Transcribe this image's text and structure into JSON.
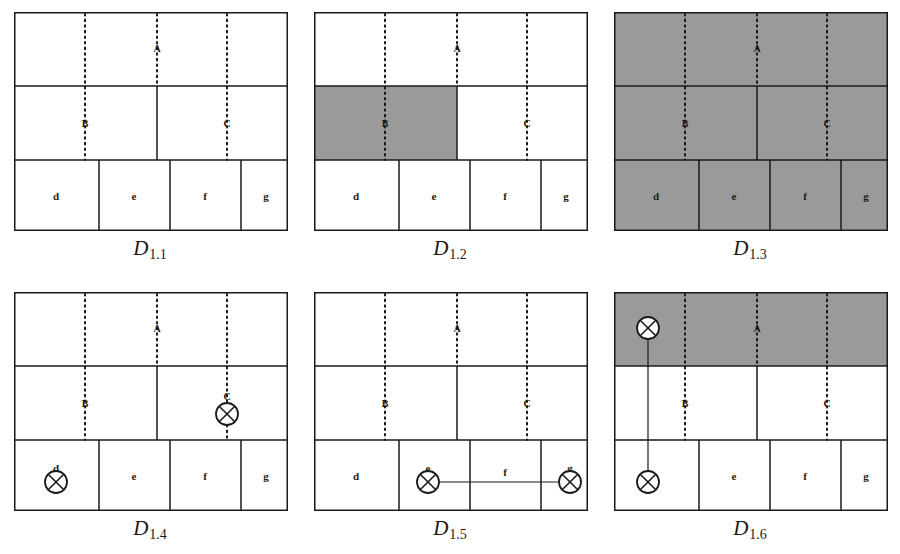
{
  "figure": {
    "kind": "grid-diagram-series",
    "background_color": "#ffffff",
    "line_color": "#1a1a1a",
    "shade_color": "#9a9a9a",
    "panel_count": 6,
    "columns": 3,
    "rows": 2
  },
  "geometry": {
    "box_width": 274,
    "box_height": 219,
    "row_dividers_y": [
      74,
      148
    ],
    "top_row_divider_x": [],
    "middle_row_divider_x": [
      143
    ],
    "bottom_row_divider_x": [
      85,
      156,
      227
    ],
    "dotted_x": [
      71,
      143,
      213
    ],
    "dotted_labels": [
      "B",
      "A",
      "C"
    ]
  },
  "node_labels": {
    "a": "A",
    "b": "B",
    "c": "C",
    "d": "d",
    "e": "e",
    "f": "f",
    "g": "g"
  },
  "panels": [
    {
      "id": "D1.1",
      "caption_main": "D",
      "caption_sub": "1.1",
      "shaded_regions": [],
      "markers": [],
      "links": []
    },
    {
      "id": "D1.2",
      "caption_main": "D",
      "caption_sub": "1.2",
      "shaded_regions": [
        {
          "name": "middle-row-left",
          "x": 0,
          "y": 74,
          "w": 143,
          "h": 74
        }
      ],
      "markers": [],
      "links": []
    },
    {
      "id": "D1.3",
      "caption_main": "D",
      "caption_sub": "1.3",
      "shaded_regions": [
        {
          "name": "whole-box",
          "x": 0,
          "y": 0,
          "w": 274,
          "h": 219
        }
      ],
      "markers": [],
      "links": []
    },
    {
      "id": "D1.4",
      "caption_main": "D",
      "caption_sub": "1.4",
      "shaded_regions": [],
      "markers": [
        {
          "name": "marker-c",
          "cx": 213,
          "cy": 122,
          "r": 11
        },
        {
          "name": "marker-d",
          "cx": 42,
          "cy": 190,
          "r": 11
        }
      ],
      "links": []
    },
    {
      "id": "D1.5",
      "caption_main": "D",
      "caption_sub": "1.5",
      "shaded_regions": [],
      "markers": [
        {
          "name": "marker-e",
          "cx": 114,
          "cy": 190,
          "r": 11
        },
        {
          "name": "marker-g",
          "cx": 256,
          "cy": 190,
          "r": 11
        }
      ],
      "links": [
        {
          "name": "link-e-g",
          "x1": 125,
          "y1": 190,
          "x2": 245,
          "y2": 190
        }
      ]
    },
    {
      "id": "D1.6",
      "caption_main": "D",
      "caption_sub": "1.6",
      "shaded_regions": [
        {
          "name": "top-row",
          "x": 0,
          "y": 0,
          "w": 274,
          "h": 74
        }
      ],
      "markers": [
        {
          "name": "marker-top",
          "cx": 34,
          "cy": 36,
          "r": 11
        },
        {
          "name": "marker-d",
          "cx": 34,
          "cy": 190,
          "r": 11
        }
      ],
      "links": [
        {
          "name": "link-top-d",
          "x1": 34,
          "y1": 47,
          "x2": 34,
          "y2": 179
        }
      ]
    }
  ]
}
